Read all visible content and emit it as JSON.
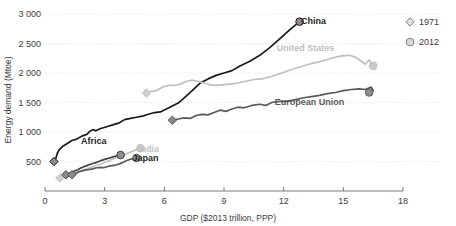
{
  "chart_data": {
    "type": "line",
    "title": "",
    "xlabel": "GDP ($2013 trillion, PPP)",
    "ylabel": "Energy demand (Mtoe)",
    "xlim": [
      0,
      18
    ],
    "ylim": [
      0,
      3000
    ],
    "xticks": [
      "0",
      "3",
      "6",
      "9",
      "12",
      "15",
      "18"
    ],
    "yticks": [
      "500",
      "1 000",
      "1 500",
      "2 000",
      "2 500",
      "3 000"
    ],
    "grid": true,
    "legend_position": "top-right",
    "legend": [
      {
        "label": "1971",
        "marker": "diamond"
      },
      {
        "label": "2012",
        "marker": "circle"
      }
    ],
    "series": [
      {
        "name": "China",
        "label": "China",
        "color": "#1a1a1a",
        "label_style": "dark",
        "label_xy": [
          13.5,
          2880
        ],
        "start": {
          "x": 0.45,
          "y": 500,
          "marker": "diamond"
        },
        "end": {
          "x": 12.8,
          "y": 2870,
          "marker": "circle"
        },
        "points": [
          [
            0.45,
            500
          ],
          [
            0.55,
            560
          ],
          [
            0.62,
            640
          ],
          [
            0.72,
            700
          ],
          [
            0.9,
            760
          ],
          [
            1.1,
            800
          ],
          [
            1.35,
            855
          ],
          [
            1.6,
            880
          ],
          [
            1.85,
            930
          ],
          [
            2.1,
            960
          ],
          [
            2.25,
            1010
          ],
          [
            2.4,
            1040
          ],
          [
            2.55,
            1020
          ],
          [
            2.8,
            1060
          ],
          [
            3.1,
            1090
          ],
          [
            3.4,
            1120
          ],
          [
            3.7,
            1150
          ],
          [
            4.0,
            1210
          ],
          [
            4.3,
            1230
          ],
          [
            4.6,
            1250
          ],
          [
            4.9,
            1270
          ],
          [
            5.2,
            1300
          ],
          [
            5.5,
            1330
          ],
          [
            5.8,
            1340
          ],
          [
            6.1,
            1390
          ],
          [
            6.4,
            1440
          ],
          [
            6.7,
            1490
          ],
          [
            7.0,
            1580
          ],
          [
            7.4,
            1700
          ],
          [
            7.8,
            1830
          ],
          [
            8.2,
            1900
          ],
          [
            8.6,
            1960
          ],
          [
            9.0,
            2000
          ],
          [
            9.4,
            2040
          ],
          [
            9.8,
            2120
          ],
          [
            10.3,
            2200
          ],
          [
            10.8,
            2300
          ],
          [
            11.3,
            2430
          ],
          [
            11.8,
            2580
          ],
          [
            12.3,
            2730
          ],
          [
            12.8,
            2870
          ]
        ]
      },
      {
        "name": "United States",
        "label": "United States",
        "color": "#bfbfbf",
        "label_style": "light",
        "label_xy": [
          13.1,
          2430
        ],
        "start": {
          "x": 5.1,
          "y": 1660,
          "marker": "diamond"
        },
        "end": {
          "x": 16.5,
          "y": 2120,
          "marker": "circle"
        },
        "points": [
          [
            5.1,
            1660
          ],
          [
            5.35,
            1690
          ],
          [
            5.6,
            1700
          ],
          [
            5.9,
            1760
          ],
          [
            6.2,
            1790
          ],
          [
            6.5,
            1790
          ],
          [
            6.8,
            1810
          ],
          [
            7.1,
            1860
          ],
          [
            7.4,
            1880
          ],
          [
            7.7,
            1860
          ],
          [
            8.0,
            1830
          ],
          [
            8.3,
            1800
          ],
          [
            8.6,
            1790
          ],
          [
            8.9,
            1800
          ],
          [
            9.3,
            1810
          ],
          [
            9.7,
            1830
          ],
          [
            10.1,
            1860
          ],
          [
            10.5,
            1890
          ],
          [
            10.9,
            1900
          ],
          [
            11.4,
            1940
          ],
          [
            11.9,
            2000
          ],
          [
            12.4,
            2060
          ],
          [
            12.9,
            2110
          ],
          [
            13.4,
            2160
          ],
          [
            13.9,
            2200
          ],
          [
            14.4,
            2250
          ],
          [
            14.9,
            2290
          ],
          [
            15.3,
            2300
          ],
          [
            15.6,
            2270
          ],
          [
            15.9,
            2200
          ],
          [
            16.1,
            2150
          ],
          [
            16.3,
            2220
          ],
          [
            16.5,
            2120
          ]
        ]
      },
      {
        "name": "European Union",
        "label": "European Union",
        "color": "#595959",
        "label_style": "mid",
        "label_xy": [
          13.3,
          1510
        ],
        "start": {
          "x": 6.4,
          "y": 1200,
          "marker": "diamond"
        },
        "end": {
          "x": 16.3,
          "y": 1670,
          "marker": "circle"
        },
        "points": [
          [
            6.4,
            1200
          ],
          [
            6.7,
            1220
          ],
          [
            7.0,
            1240
          ],
          [
            7.3,
            1230
          ],
          [
            7.6,
            1280
          ],
          [
            7.9,
            1300
          ],
          [
            8.2,
            1290
          ],
          [
            8.5,
            1330
          ],
          [
            8.8,
            1370
          ],
          [
            9.1,
            1350
          ],
          [
            9.4,
            1390
          ],
          [
            9.7,
            1420
          ],
          [
            10.0,
            1410
          ],
          [
            10.4,
            1450
          ],
          [
            10.8,
            1470
          ],
          [
            11.1,
            1450
          ],
          [
            11.4,
            1500
          ],
          [
            11.8,
            1520
          ],
          [
            12.2,
            1520
          ],
          [
            12.6,
            1550
          ],
          [
            13.0,
            1580
          ],
          [
            13.4,
            1600
          ],
          [
            13.8,
            1620
          ],
          [
            14.2,
            1650
          ],
          [
            14.6,
            1670
          ],
          [
            15.0,
            1700
          ],
          [
            15.4,
            1720
          ],
          [
            15.8,
            1730
          ],
          [
            16.1,
            1720
          ],
          [
            16.4,
            1760
          ],
          [
            16.5,
            1700
          ],
          [
            16.3,
            1670
          ]
        ]
      },
      {
        "name": "Africa",
        "label": "Africa",
        "color": "#404040",
        "label_style": "dark",
        "label_xy": [
          2.45,
          855
        ],
        "start": {
          "x": 1.05,
          "y": 275,
          "marker": "diamond"
        },
        "end": {
          "x": 3.8,
          "y": 610,
          "marker": "circle"
        },
        "points": [
          [
            1.05,
            275
          ],
          [
            1.2,
            300
          ],
          [
            1.35,
            320
          ],
          [
            1.5,
            340
          ],
          [
            1.65,
            360
          ],
          [
            1.8,
            390
          ],
          [
            1.95,
            410
          ],
          [
            2.1,
            430
          ],
          [
            2.25,
            450
          ],
          [
            2.4,
            465
          ],
          [
            2.55,
            480
          ],
          [
            2.7,
            500
          ],
          [
            2.85,
            520
          ],
          [
            3.0,
            535
          ],
          [
            3.2,
            555
          ],
          [
            3.4,
            575
          ],
          [
            3.6,
            595
          ],
          [
            3.8,
            610
          ]
        ]
      },
      {
        "name": "India",
        "label": "India",
        "color": "#bfbfbf",
        "label_style": "light",
        "label_xy": [
          5.2,
          720
        ],
        "start": {
          "x": 0.75,
          "y": 220,
          "marker": "diamond"
        },
        "end": {
          "x": 4.8,
          "y": 725,
          "marker": "circle"
        },
        "points": [
          [
            0.75,
            220
          ],
          [
            0.95,
            245
          ],
          [
            1.15,
            265
          ],
          [
            1.4,
            290
          ],
          [
            1.65,
            320
          ],
          [
            1.9,
            350
          ],
          [
            2.15,
            380
          ],
          [
            2.4,
            410
          ],
          [
            2.65,
            440
          ],
          [
            2.9,
            470
          ],
          [
            3.15,
            505
          ],
          [
            3.4,
            540
          ],
          [
            3.7,
            580
          ],
          [
            4.0,
            620
          ],
          [
            4.3,
            660
          ],
          [
            4.55,
            695
          ],
          [
            4.8,
            725
          ]
        ]
      },
      {
        "name": "Japan",
        "label": "Japan",
        "color": "#595959",
        "label_style": "dark",
        "label_xy": [
          5.05,
          560
        ],
        "start": {
          "x": 1.35,
          "y": 275,
          "marker": "diamond"
        },
        "end": {
          "x": 4.6,
          "y": 560,
          "marker": "circle"
        },
        "points": [
          [
            1.35,
            275
          ],
          [
            1.55,
            300
          ],
          [
            1.75,
            330
          ],
          [
            1.95,
            350
          ],
          [
            2.15,
            360
          ],
          [
            2.35,
            370
          ],
          [
            2.55,
            390
          ],
          [
            2.75,
            400
          ],
          [
            2.95,
            395
          ],
          [
            3.15,
            415
          ],
          [
            3.35,
            430
          ],
          [
            3.55,
            440
          ],
          [
            3.75,
            460
          ],
          [
            3.95,
            490
          ],
          [
            4.15,
            520
          ],
          [
            4.35,
            545
          ],
          [
            4.6,
            560
          ]
        ]
      }
    ]
  }
}
